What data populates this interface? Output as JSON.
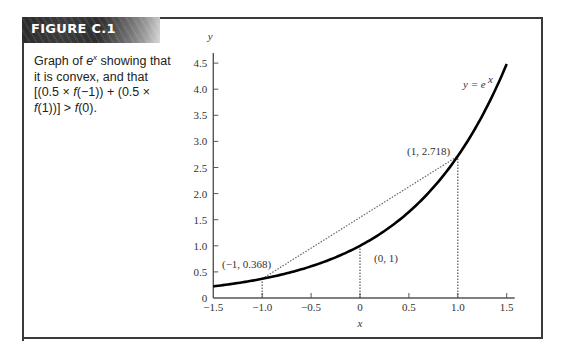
{
  "figure": {
    "label": "FIGURE C.1",
    "caption_parts": {
      "p1": "Graph of ",
      "e": "e",
      "x_sup": "x",
      "p2": " showing that it is convex, and that [(0.5 × ",
      "f1": "f",
      "p3": "(−1)) + (0.5 × ",
      "f2": "f",
      "p4": "(1))] > ",
      "f3": "f",
      "p5": "(0)."
    }
  },
  "colors": {
    "frame": "#3a3a3a",
    "curve": "#000000",
    "dotted": "#555555",
    "text": "#333333"
  },
  "chart_data": {
    "type": "line",
    "xlabel": "x",
    "ylabel": "y",
    "xlim": [
      -1.5,
      1.5
    ],
    "ylim": [
      0,
      4.5
    ],
    "grid": false,
    "x_ticks": [
      -1.5,
      -1.0,
      -0.5,
      0,
      0.5,
      1.0,
      1.5
    ],
    "x_tick_labels": [
      "−1.5",
      "−1.0",
      "−0.5",
      "0",
      "0.5",
      "1.0",
      "1.5"
    ],
    "y_ticks": [
      0,
      0.5,
      1.0,
      1.5,
      2.0,
      2.5,
      3.0,
      3.5,
      4.0,
      4.5
    ],
    "y_tick_labels": [
      "0",
      "0.5",
      "1.0",
      "1.5",
      "2.0",
      "2.5",
      "3.0",
      "3.5",
      "4.0",
      "4.5"
    ],
    "series": [
      {
        "name": "y = e^x",
        "function": "exp",
        "x": [
          -1.5,
          -1.25,
          -1.0,
          -0.75,
          -0.5,
          -0.25,
          0,
          0.25,
          0.5,
          0.75,
          1.0,
          1.25,
          1.5
        ],
        "values": [
          0.223,
          0.287,
          0.368,
          0.472,
          0.607,
          0.779,
          1.0,
          1.284,
          1.649,
          2.117,
          2.718,
          3.49,
          4.482
        ]
      }
    ],
    "chord": {
      "from": [
        -1,
        0.368
      ],
      "to": [
        1,
        2.718
      ],
      "style": "dotted"
    },
    "drop_lines": [
      {
        "x": -1,
        "y": 0.368
      },
      {
        "x": 0,
        "y": 1.0
      },
      {
        "x": 1,
        "y": 2.718
      }
    ],
    "annotations": [
      {
        "text": "(−1, 0.368)",
        "x": -1,
        "y": 0.368
      },
      {
        "text": "(0, 1)",
        "x": 0,
        "y": 1.0
      },
      {
        "text": "(1, 2.718)",
        "x": 1,
        "y": 2.718
      },
      {
        "text": "y = e",
        "sup": "x",
        "x": 1.35,
        "y": 4.1
      }
    ]
  }
}
